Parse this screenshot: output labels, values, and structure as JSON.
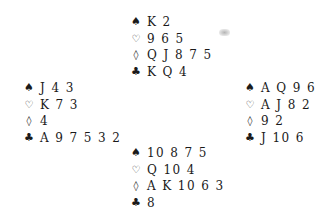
{
  "diagram": {
    "type": "bridge-deal",
    "suits": {
      "spades": "♠",
      "hearts": "♡",
      "diamonds": "◊",
      "clubs": "♣"
    },
    "hands": {
      "north": {
        "spades": "K 2",
        "hearts": "9 6 5",
        "diamonds": "Q J 8 7 5",
        "clubs": "K Q 4"
      },
      "west": {
        "spades": "J 4 3",
        "hearts": "K 7 3",
        "diamonds": "4",
        "clubs": "A 9 7 5 3 2"
      },
      "east": {
        "spades": "A Q 9 6",
        "hearts": "A J 8 2",
        "diamonds": "9 2",
        "clubs": "J 10 6"
      },
      "south": {
        "spades": "10 8 7 5",
        "hearts": "Q 10 4",
        "diamonds": "A K 10 6 3",
        "clubs": "8"
      }
    }
  }
}
